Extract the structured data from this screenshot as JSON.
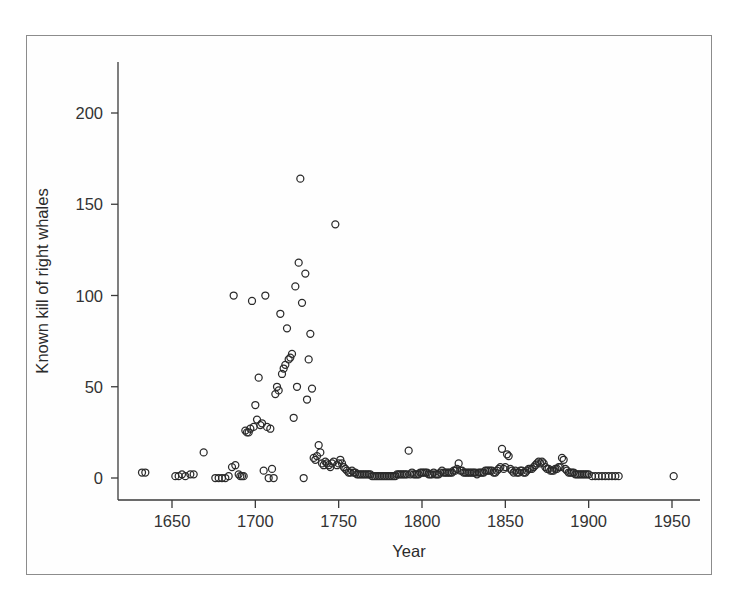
{
  "figure": {
    "background_color": "#ffffff",
    "frame_color": "#8c8c8c",
    "axis_color": "#3a3a3a",
    "marker_color": "#2a2a2a"
  },
  "chart_data": {
    "type": "scatter",
    "title": "",
    "subtitle": "",
    "xlabel": "Year",
    "ylabel": "Known kill of right whales",
    "xlim": [
      1625,
      1960
    ],
    "ylim": [
      -8,
      230
    ],
    "xticks": [
      1650,
      1700,
      1750,
      1800,
      1850,
      1900,
      1950
    ],
    "xticklabels": [
      "1650",
      "1700",
      "1750",
      "1800",
      "1850",
      "1900",
      "1950"
    ],
    "yticks": [
      0,
      50,
      100,
      150,
      200
    ],
    "yticklabels": [
      "0",
      "50",
      "100",
      "150",
      "200"
    ],
    "grid": false,
    "legend": null,
    "marker": "open-circle",
    "marker_size_px": 7,
    "series": [
      {
        "name": "Known kill of right whales",
        "x": [
          1632,
          1634,
          1652,
          1654,
          1656,
          1658,
          1661,
          1663,
          1669,
          1676,
          1678,
          1680,
          1682,
          1684,
          1686,
          1687,
          1688,
          1690,
          1691,
          1692,
          1693,
          1694,
          1695,
          1696,
          1697,
          1698,
          1699,
          1700,
          1701,
          1702,
          1703,
          1704,
          1705,
          1706,
          1707,
          1708,
          1709,
          1710,
          1711,
          1712,
          1713,
          1714,
          1715,
          1716,
          1717,
          1718,
          1719,
          1720,
          1721,
          1722,
          1723,
          1724,
          1725,
          1726,
          1727,
          1728,
          1729,
          1730,
          1731,
          1732,
          1733,
          1734,
          1735,
          1736,
          1737,
          1738,
          1739,
          1740,
          1741,
          1742,
          1743,
          1744,
          1745,
          1746,
          1747,
          1748,
          1749,
          1750,
          1751,
          1752,
          1753,
          1754,
          1755,
          1756,
          1757,
          1758,
          1759,
          1760,
          1761,
          1762,
          1763,
          1764,
          1765,
          1766,
          1767,
          1768,
          1769,
          1770,
          1771,
          1772,
          1773,
          1774,
          1775,
          1776,
          1777,
          1778,
          1779,
          1780,
          1781,
          1782,
          1783,
          1784,
          1785,
          1786,
          1787,
          1788,
          1789,
          1790,
          1791,
          1792,
          1793,
          1794,
          1795,
          1796,
          1797,
          1798,
          1799,
          1800,
          1801,
          1802,
          1803,
          1804,
          1805,
          1806,
          1807,
          1808,
          1809,
          1810,
          1811,
          1812,
          1813,
          1814,
          1815,
          1816,
          1817,
          1818,
          1819,
          1820,
          1821,
          1822,
          1823,
          1824,
          1825,
          1826,
          1827,
          1828,
          1829,
          1830,
          1831,
          1832,
          1833,
          1834,
          1835,
          1836,
          1837,
          1838,
          1839,
          1840,
          1841,
          1842,
          1843,
          1844,
          1845,
          1846,
          1847,
          1848,
          1849,
          1850,
          1851,
          1852,
          1853,
          1854,
          1855,
          1856,
          1857,
          1858,
          1859,
          1860,
          1861,
          1862,
          1863,
          1864,
          1865,
          1866,
          1867,
          1868,
          1869,
          1870,
          1871,
          1872,
          1873,
          1874,
          1875,
          1876,
          1877,
          1878,
          1879,
          1880,
          1881,
          1882,
          1883,
          1884,
          1885,
          1886,
          1887,
          1888,
          1889,
          1890,
          1891,
          1892,
          1893,
          1894,
          1895,
          1896,
          1897,
          1898,
          1899,
          1900,
          1902,
          1904,
          1906,
          1908,
          1910,
          1912,
          1914,
          1916,
          1918,
          1951
        ],
        "y": [
          3,
          3,
          1,
          1,
          2,
          1,
          2,
          2,
          14,
          0,
          0,
          0,
          0,
          1,
          6,
          100,
          7,
          2,
          1,
          1,
          1,
          26,
          25,
          25,
          27,
          97,
          28,
          40,
          32,
          55,
          29,
          30,
          4,
          100,
          28,
          0,
          27,
          5,
          0,
          46,
          50,
          48,
          90,
          57,
          60,
          62,
          82,
          65,
          66,
          68,
          33,
          105,
          50,
          118,
          164,
          96,
          0,
          112,
          43,
          65,
          79,
          49,
          11,
          10,
          12,
          18,
          14,
          8,
          7,
          9,
          8,
          7,
          6,
          8,
          9,
          139,
          7,
          8,
          10,
          8,
          6,
          5,
          4,
          3,
          3,
          4,
          3,
          3,
          2,
          2,
          2,
          2,
          2,
          2,
          2,
          2,
          2,
          1,
          1,
          1,
          1,
          1,
          1,
          1,
          1,
          1,
          1,
          1,
          1,
          1,
          1,
          1,
          2,
          2,
          2,
          2,
          2,
          2,
          2,
          15,
          2,
          3,
          2,
          2,
          2,
          2,
          3,
          3,
          3,
          3,
          3,
          2,
          2,
          2,
          3,
          2,
          2,
          2,
          3,
          4,
          3,
          3,
          3,
          3,
          3,
          3,
          4,
          4,
          5,
          8,
          4,
          4,
          3,
          3,
          3,
          3,
          3,
          3,
          3,
          3,
          2,
          3,
          3,
          3,
          3,
          4,
          4,
          4,
          4,
          4,
          3,
          3,
          4,
          5,
          6,
          16,
          5,
          6,
          13,
          12,
          5,
          4,
          3,
          4,
          3,
          3,
          4,
          4,
          3,
          3,
          4,
          5,
          5,
          5,
          6,
          7,
          8,
          9,
          8,
          9,
          8,
          6,
          5,
          5,
          4,
          4,
          4,
          5,
          5,
          6,
          6,
          11,
          10,
          5,
          4,
          3,
          3,
          3,
          3,
          2,
          2,
          2,
          2,
          2,
          2,
          2,
          2,
          2,
          1,
          1,
          1,
          1,
          1,
          1,
          1,
          1,
          1,
          1
        ]
      }
    ]
  }
}
